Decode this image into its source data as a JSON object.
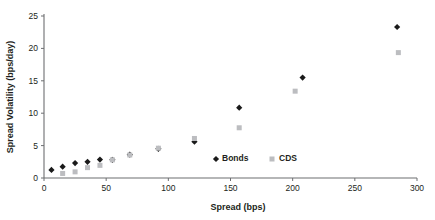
{
  "chart_data": {
    "type": "scatter",
    "title": "",
    "xlabel": "Spread (bps)",
    "ylabel": "Spread Volatility (bps/day)",
    "xlim": [
      0,
      300
    ],
    "ylim": [
      0,
      25
    ],
    "xticks": [
      0,
      50,
      100,
      150,
      200,
      250,
      300
    ],
    "yticks": [
      0,
      5,
      10,
      15,
      20,
      25
    ],
    "grid": false,
    "legend_position": "inside-lower-right",
    "series": [
      {
        "name": "Bonds",
        "marker": "diamond",
        "color": "#1a1a1a",
        "points": [
          {
            "x": 6,
            "y": 1.25
          },
          {
            "x": 15,
            "y": 1.75
          },
          {
            "x": 25,
            "y": 2.3
          },
          {
            "x": 35,
            "y": 2.5
          },
          {
            "x": 45,
            "y": 2.85
          },
          {
            "x": 55,
            "y": 2.8
          },
          {
            "x": 69,
            "y": 3.6
          },
          {
            "x": 92,
            "y": 4.5
          },
          {
            "x": 121,
            "y": 5.6
          },
          {
            "x": 157,
            "y": 10.85
          },
          {
            "x": 208,
            "y": 15.5
          },
          {
            "x": 284,
            "y": 23.3
          }
        ]
      },
      {
        "name": "CDS",
        "marker": "square",
        "color": "#bcbdc0",
        "points": [
          {
            "x": 15,
            "y": 0.7
          },
          {
            "x": 25,
            "y": 0.95
          },
          {
            "x": 35,
            "y": 1.6
          },
          {
            "x": 45,
            "y": 1.95
          },
          {
            "x": 55,
            "y": 2.8
          },
          {
            "x": 69,
            "y": 3.55
          },
          {
            "x": 92,
            "y": 4.6
          },
          {
            "x": 121,
            "y": 6.1
          },
          {
            "x": 157,
            "y": 7.75
          },
          {
            "x": 202,
            "y": 13.4
          },
          {
            "x": 285,
            "y": 19.35
          }
        ]
      }
    ]
  },
  "legend": {
    "bonds_label": "Bonds",
    "cds_label": "CDS"
  },
  "axis_labels": {
    "x_title": "Spread (bps)",
    "y_title": "Spread Volatility (bps/day)"
  },
  "colors": {
    "bonds": "#1a1a1a",
    "cds": "#bcbdc0",
    "axis": "#6d6e71",
    "text": "#231f20",
    "background": "#ffffff"
  }
}
